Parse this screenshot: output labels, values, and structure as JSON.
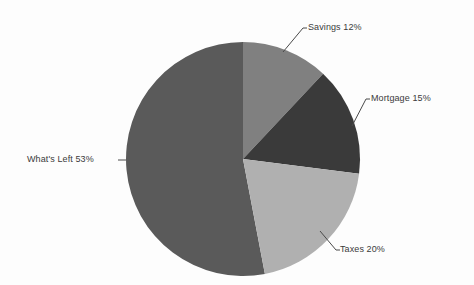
{
  "background_color": "#fdfdfd",
  "text_color": "#3b3b3b",
  "chart_data": {
    "type": "pie",
    "title": "",
    "subtitle": "",
    "xlabel": "",
    "ylabel": "",
    "legend_position": "none",
    "grid": false,
    "label_style": "leader-line callouts outside slices",
    "start_angle_deg": 0,
    "direction": "clockwise",
    "categories": [
      "Savings",
      "Mortgage",
      "Taxes",
      "What's Left"
    ],
    "values": [
      12,
      15,
      20,
      53
    ],
    "unit": "%",
    "colors": [
      "#808080",
      "#3a3a3a",
      "#b0b0b0",
      "#5a5a5a"
    ],
    "slices": [
      {
        "name": "Savings",
        "value": 12,
        "label": "Savings 12%",
        "color": "#808080",
        "start_angle_deg": 0,
        "end_angle_deg": 43.2
      },
      {
        "name": "Mortgage",
        "value": 15,
        "label": "Mortgage 15%",
        "color": "#3a3a3a",
        "start_angle_deg": 43.2,
        "end_angle_deg": 97.2
      },
      {
        "name": "Taxes",
        "value": 20,
        "label": "Taxes 20%",
        "color": "#b0b0b0",
        "start_angle_deg": 97.2,
        "end_angle_deg": 169.2
      },
      {
        "name": "What's Left",
        "value": 53,
        "label": "What's Left 53%",
        "color": "#5a5a5a",
        "start_angle_deg": 169.2,
        "end_angle_deg": 360
      }
    ]
  },
  "labels": {
    "savings": "Savings 12%",
    "mortgage": "Mortgage 15%",
    "taxes": "Taxes 20%",
    "whats_left": "What's Left 53%"
  }
}
